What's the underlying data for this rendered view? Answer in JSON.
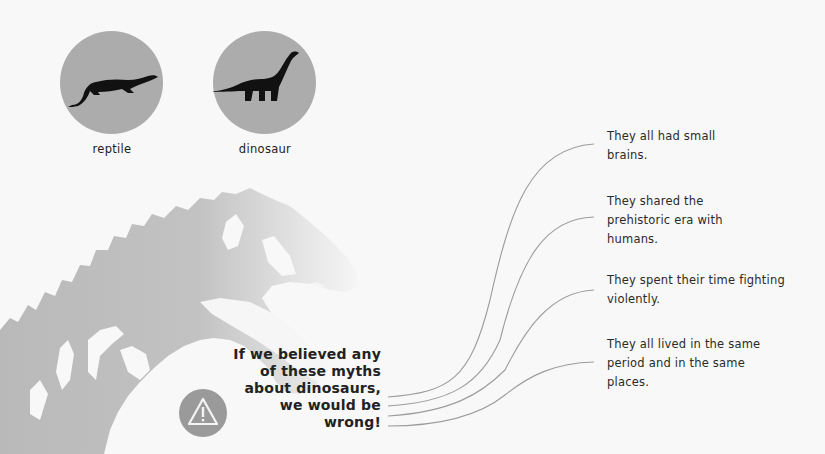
{
  "comparison": {
    "items": [
      {
        "label": "reptile",
        "icon": "crocodile-silhouette-icon"
      },
      {
        "label": "dinosaur",
        "icon": "sauropod-silhouette-icon"
      }
    ]
  },
  "headline": {
    "lines": [
      "If we believed any",
      "of these myths",
      "about dinosaurs,",
      "we would be",
      "wrong!"
    ]
  },
  "warning": {
    "icon": "warning-triangle-icon"
  },
  "myths": [
    {
      "lines": [
        "They all had small",
        "brains."
      ]
    },
    {
      "lines": [
        "They shared the",
        "prehistoric era with",
        "humans."
      ]
    },
    {
      "lines": [
        "They spent their time fighting",
        "violently."
      ]
    },
    {
      "lines": [
        "They all lived in the same",
        "period and in the same",
        "places."
      ]
    }
  ],
  "colors": {
    "background": "#f8f8f8",
    "circle": "#acacac",
    "silhouette": "#111111",
    "skeleton": "#bdbdbd",
    "warning_circle": "#9a9a9a",
    "connector": "#9c9c9c",
    "text": "#222222"
  }
}
